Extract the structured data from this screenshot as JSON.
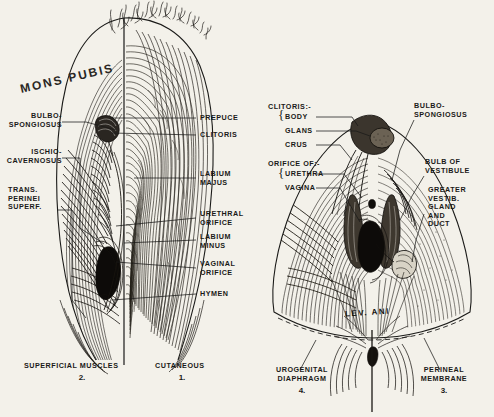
{
  "plate": {
    "background_color": "#f3f1ea",
    "ink_color": "#1a1a18"
  },
  "figure_left": {
    "heading": "MONS PUBIS",
    "caption": "SUPERFICIAL MUSCLES",
    "caption_number": "2.",
    "caption_right": "CUTANEOUS",
    "caption_right_number": "1.",
    "labels_left": [
      {
        "id": "bulbospongiosus",
        "line1": "BULBO-",
        "line2": "SPONGIOSUS"
      },
      {
        "id": "ischiocavernosus",
        "line1": "ISCHIO-",
        "line2": "CAVERNOSUS"
      },
      {
        "id": "trans-perinei",
        "line1": "TRANS.",
        "line2": "PERINEI",
        "line3": "SUPERF."
      }
    ],
    "labels_right": [
      {
        "id": "preputium",
        "line1": "PREPUCE"
      },
      {
        "id": "clitoris",
        "line1": "CLITORIS"
      },
      {
        "id": "labium-majus",
        "line1": "LABIUM",
        "line2": "MAJUS"
      },
      {
        "id": "urethral-orifice",
        "line1": "URETHRAL",
        "line2": "ORIFICE"
      },
      {
        "id": "labium-minus",
        "line1": "LABIUM",
        "line2": "MINUS"
      },
      {
        "id": "vaginal-orifice",
        "line1": "VAGINAL",
        "line2": "ORIFICE"
      },
      {
        "id": "hymen",
        "line1": "HYMEN"
      }
    ]
  },
  "figure_right": {
    "caption_left": "UROGENITAL",
    "caption_left2": "DIAPHRAGM",
    "caption_left_number": "4.",
    "caption_right": "PERINEAL",
    "caption_right2": "MEMBRANE",
    "caption_right_number": "3.",
    "inline_text": "LEV. ANI",
    "group_clitoris": "CLITORIS:-",
    "group_clitoris_items": [
      "BODY",
      "GLANS",
      "CRUS"
    ],
    "group_orifice": "ORIFICE OF:-",
    "group_orifice_items": [
      "URETHRA",
      "VAGINA"
    ],
    "labels_right": [
      {
        "id": "bulbospongiosus-r",
        "line1": "BULBO-",
        "line2": "SPONGIOSUS"
      },
      {
        "id": "bulb-of-vestibule",
        "line1": "BULB OF",
        "line2": "VESTIBULE"
      },
      {
        "id": "greater-vestibular-gland",
        "line1": "GREATER",
        "line2": "VESTIB.",
        "line3": "GLAND",
        "line4": "AND",
        "line5": "DUCT"
      }
    ]
  }
}
